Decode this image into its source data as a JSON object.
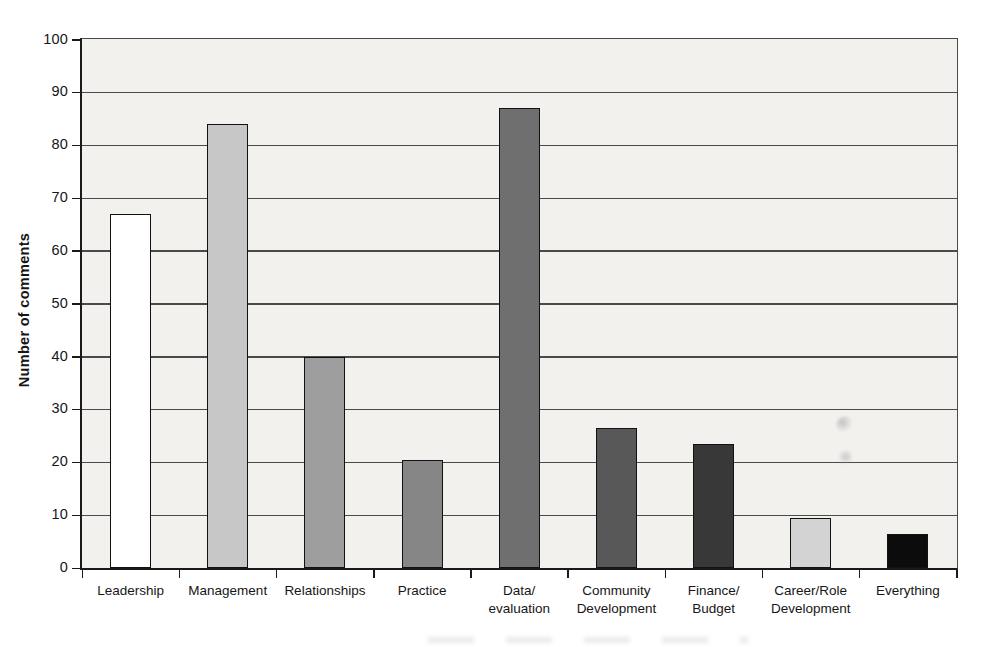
{
  "figure": {
    "kind": "scanned grayscale bar chart, no title, no legend",
    "background": "#ffffff"
  },
  "chart_data": {
    "type": "bar",
    "title": "",
    "xlabel": "",
    "ylabel": "Number of comments",
    "ylim": [
      0,
      100
    ],
    "yticks": [
      0,
      10,
      20,
      30,
      40,
      50,
      60,
      70,
      80,
      90,
      100
    ],
    "grid": "horizontal gridlines every 10 units",
    "legend": "none",
    "categories": [
      "Leadership",
      "Management",
      "Relationships",
      "Practice",
      "Data/\nevaluation",
      "Community\nDevelopment",
      "Finance/\nBudget",
      "Career/Role\nDevelopment",
      "Everything"
    ],
    "values": [
      67,
      84,
      40,
      20.5,
      87,
      26.5,
      23.5,
      9.5,
      6.5
    ],
    "bar_fill_colors": [
      "#ffffff",
      "#c7c7c7",
      "#9e9e9e",
      "#868686",
      "#6f6f6f",
      "#585858",
      "#383838",
      "#d3d3d3",
      "#0c0c0c"
    ],
    "bar_border_color": "#121212",
    "plot_background": "#f2f1ee",
    "gridline_color": "#4a4a4a",
    "axis_color": "#1a1a1a",
    "text_color": "#161616"
  }
}
